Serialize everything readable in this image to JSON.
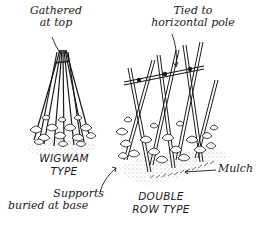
{
  "diagram": {
    "subjects": [
      {
        "id": "wigwam",
        "title_line1": "WIGWAM",
        "title_line2": "TYPE"
      },
      {
        "id": "double-row",
        "title_line1": "DOUBLE",
        "title_line2": "ROW TYPE"
      }
    ],
    "annotations": {
      "gathered_line1": "Gathered",
      "gathered_line2": "at top",
      "tied_line1": "Tied to",
      "tied_line2": "horizontal pole",
      "supports_line1": "Supports",
      "supports_line2": "buried at base",
      "mulch": "Mulch"
    },
    "colors": {
      "ink": "#1a1a1a",
      "background": "#ffffff",
      "stipple": "#555555"
    }
  }
}
